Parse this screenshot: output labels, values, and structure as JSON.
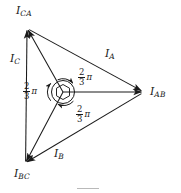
{
  "figure": {
    "type": "phasor-diagram",
    "background_color": "#ffffff",
    "stroke_color": "#1a1a1a",
    "label_color": "#1a1a1a",
    "caption_rule_color": "#b9b9b9",
    "width": 181,
    "height": 193
  },
  "labels": {
    "i_ca": {
      "symbol": "I",
      "subscript": "CA"
    },
    "i_bc": {
      "symbol": "I",
      "subscript": "BC"
    },
    "i_ab": {
      "symbol": "I",
      "subscript": "AB"
    },
    "i_a": {
      "symbol": "I",
      "subscript": "A"
    },
    "i_b": {
      "symbol": "I",
      "subscript": "B"
    },
    "i_c": {
      "symbol": "I",
      "subscript": "C"
    },
    "angle_left": {
      "numerator": "2",
      "denominator": "3",
      "unit": "π"
    },
    "angle_upper_right": {
      "numerator": "2",
      "denominator": "3",
      "unit": "π"
    },
    "angle_lower_right": {
      "numerator": "2",
      "denominator": "3",
      "unit": "π"
    }
  },
  "geometry": {
    "center": {
      "x": 63,
      "y": 92
    },
    "vertices": {
      "i_ca": {
        "x": 27,
        "y": 28
      },
      "i_bc": {
        "x": 25,
        "y": 163
      },
      "i_ab": {
        "x": 143,
        "y": 92
      }
    },
    "hub_circle_radius": 11.5,
    "hub_hexagon_radius": 7.5,
    "phasors": [
      {
        "name": "I_CA",
        "from": "center",
        "to": "i_ca"
      },
      {
        "name": "I_BC",
        "from": "center",
        "to": "i_bc"
      },
      {
        "name": "I_AB",
        "from": "center",
        "to": "i_ab"
      }
    ],
    "triangle_sides": [
      {
        "name": "I_C",
        "from": "i_bc",
        "to": "i_ca"
      },
      {
        "name": "I_A",
        "from": "i_ca",
        "to": "i_ab"
      },
      {
        "name": "I_B",
        "from": "i_ab",
        "to": "i_bc"
      }
    ],
    "angle_arcs": 3,
    "angle_value_radians": "2π/3",
    "angle_value_degrees": 120
  }
}
